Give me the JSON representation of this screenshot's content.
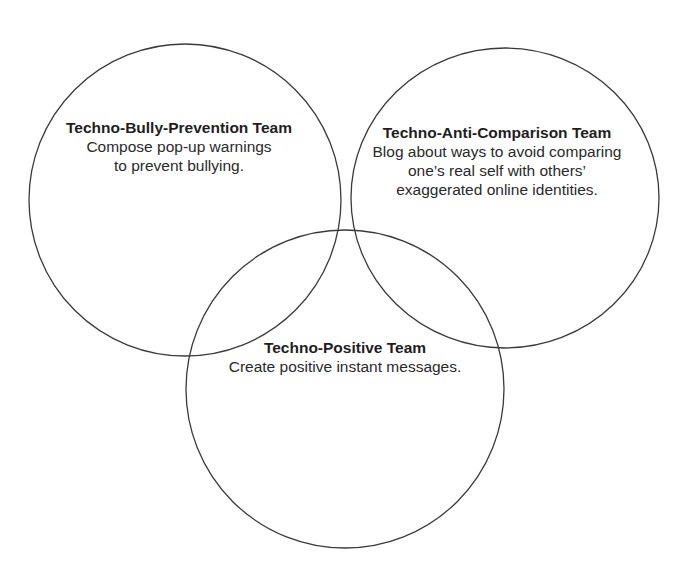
{
  "diagram": {
    "type": "venn",
    "stroke_color": "#3a3a3a",
    "circles": [
      {
        "id": "bully-prevention",
        "title": "Techno-Bully-Prevention Team",
        "description": "Compose pop-up warnings to prevent bullying."
      },
      {
        "id": "anti-comparison",
        "title": "Techno-Anti-Comparison Team",
        "description": "Blog about ways to avoid comparing one’s real self with others’ exaggerated online identities."
      },
      {
        "id": "positive",
        "title": "Techno-Positive Team",
        "description": "Create positive instant messages."
      }
    ]
  }
}
